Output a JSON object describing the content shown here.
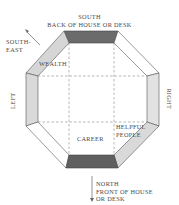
{
  "diagram": {
    "type": "bagua-octagon",
    "labels": {
      "top_line1": "SOUTH",
      "top_line2": "BACK OF HOUSE OR DESK",
      "southeast_line1": "SOUTH-",
      "southeast_line2": "EAST",
      "left": "LEFT",
      "right": "RIGHT",
      "wealth": "WEALTH",
      "career": "CAREER",
      "helpful_line1": "HELPFUL",
      "helpful_line2": "PEOPLE",
      "bottom_line1": "NORTH",
      "bottom_line2": "FRONT OF HOUSE",
      "bottom_line3": "OR DESK"
    },
    "colors": {
      "dark_band": "#6b6b6b",
      "light_band": "#d9d9d9",
      "white_band": "#ffffff",
      "outline": "#555555",
      "dashed_grid": "#888888"
    }
  }
}
